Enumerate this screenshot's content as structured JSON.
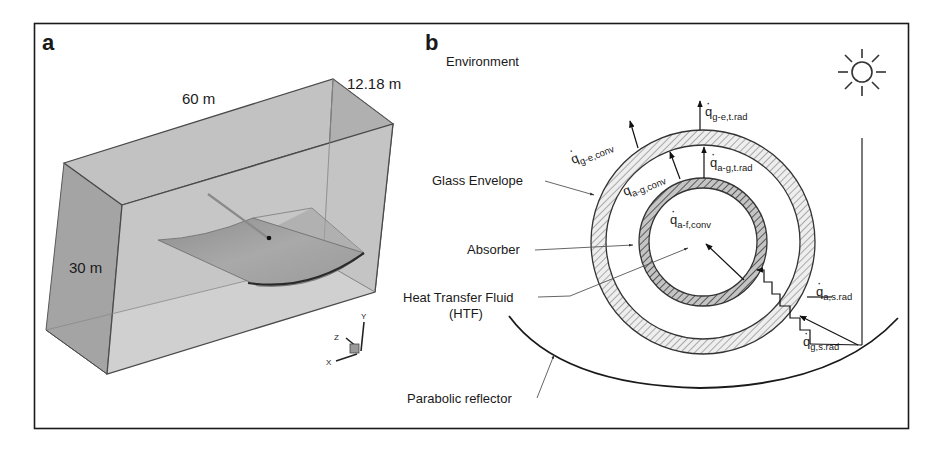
{
  "figure": {
    "panels": [
      {
        "id": "a",
        "label": "a",
        "dimensions": {
          "length": "60 m",
          "depth": "12.18 m",
          "height": "30 m"
        },
        "axes": {
          "x": "X",
          "y": "Y",
          "z": "Z"
        }
      },
      {
        "id": "b",
        "label": "b",
        "regions": {
          "environment": "Environment",
          "glass_envelope": "Glass Envelope",
          "absorber": "Absorber",
          "htf_line1": "Heat Transfer Fluid",
          "htf_line2": "(HTF)",
          "reflector": "Parabolic reflector"
        },
        "heat_fluxes": [
          {
            "symbol": "q",
            "sub": "g-e,conv"
          },
          {
            "symbol": "q",
            "sub": "g-e,t.rad"
          },
          {
            "symbol": "q",
            "sub": "a-g,conv"
          },
          {
            "symbol": "q",
            "sub": "a-g,t.rad"
          },
          {
            "symbol": "q",
            "sub": "a-f,conv"
          },
          {
            "symbol": "q",
            "sub": "a,s.rad"
          },
          {
            "symbol": "q",
            "sub": "g,s.rad"
          }
        ],
        "icons": {
          "sun": "sun-icon"
        }
      }
    ],
    "colors": {
      "frame": "#1a1a1a",
      "box_face_light": "#c9c9c9",
      "box_face_mid": "#b3b3b3",
      "box_face_dark": "#a6a6a6",
      "box_edge": "#4a4a4a",
      "glass_hatch_bg": "#e8e8e8",
      "absorber_hatch_bg": "#9a9a9a"
    }
  }
}
